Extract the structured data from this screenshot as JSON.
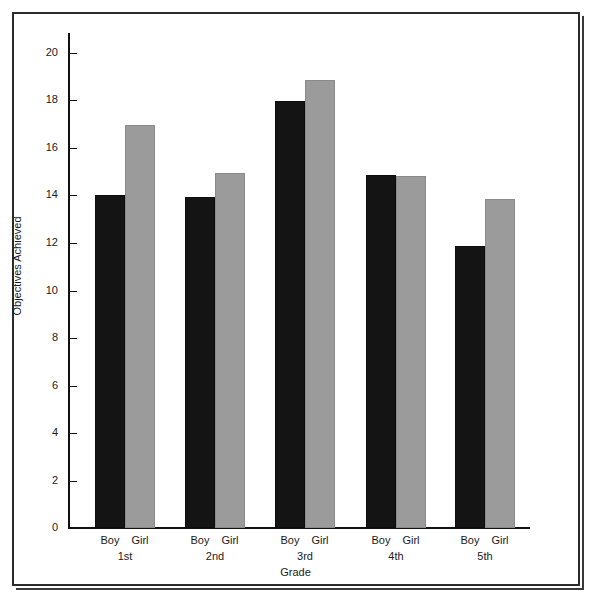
{
  "chart_data": {
    "type": "bar",
    "title": "",
    "xlabel": "Grade",
    "ylabel": "Objectives Achieved",
    "categories": [
      "1st",
      "2nd",
      "3rd",
      "4th",
      "5th"
    ],
    "series": [
      {
        "name": "Boy",
        "values": [
          14.0,
          13.9,
          17.95,
          14.85,
          11.85
        ]
      },
      {
        "name": "Girl",
        "values": [
          16.95,
          14.95,
          18.85,
          14.8,
          13.85
        ]
      }
    ],
    "ylim": [
      0,
      21
    ],
    "yticks": [
      0,
      2,
      4,
      6,
      8,
      10,
      12,
      14,
      16,
      18,
      20
    ],
    "ytick_labels": [
      "0",
      "2",
      "4",
      "6",
      "8",
      "10",
      "12",
      "14",
      "16",
      "18",
      "20"
    ],
    "grid": false,
    "legend": "none",
    "colors": {
      "boy": "#141414",
      "girl": "#9b9b9b",
      "axis": "#111111",
      "frame": "#2b2b2b",
      "background": "#ffffff"
    },
    "group_series_labels": [
      "Boy",
      "Girl"
    ]
  }
}
